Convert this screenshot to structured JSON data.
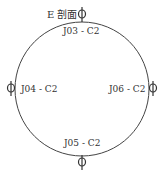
{
  "diagram": {
    "title": "E 剖面",
    "shape": "circle",
    "labels": {
      "top": "J03 - C2",
      "left": "J04 - C2",
      "right": "J06 - C2",
      "bottom": "J05 - C2"
    },
    "marker_symbol": "ϕ",
    "colors": {
      "stroke": "#444444",
      "text": "#333333",
      "background": "#ffffff"
    }
  }
}
